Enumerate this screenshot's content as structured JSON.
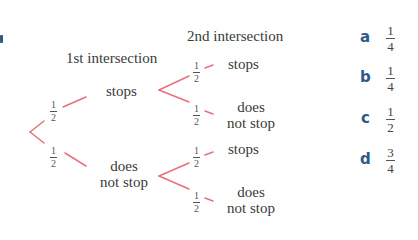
{
  "colors": {
    "branch": "#e8707c",
    "text": "#3a3a3a",
    "key": "#2e5a87"
  },
  "headers": {
    "first": "1st intersection",
    "second": "2nd intersection"
  },
  "tree": {
    "level1": [
      {
        "label": "stops",
        "prob": {
          "num": "1",
          "den": "2"
        }
      },
      {
        "label_line1": "does",
        "label_line2": "not stop",
        "prob": {
          "num": "1",
          "den": "2"
        }
      }
    ],
    "level2_top": [
      {
        "label": "stops",
        "prob": {
          "num": "1",
          "den": "2"
        }
      },
      {
        "label_line1": "does",
        "label_line2": "not stop",
        "prob": {
          "num": "1",
          "den": "2"
        }
      }
    ],
    "level2_bottom": [
      {
        "label": "stops",
        "prob": {
          "num": "1",
          "den": "2"
        }
      },
      {
        "label_line1": "does",
        "label_line2": "not stop",
        "prob": {
          "num": "1",
          "den": "2"
        }
      }
    ]
  },
  "answers": [
    {
      "key": "a",
      "num": "1",
      "den": "4"
    },
    {
      "key": "b",
      "num": "1",
      "den": "4"
    },
    {
      "key": "c",
      "num": "1",
      "den": "2"
    },
    {
      "key": "d",
      "num": "3",
      "den": "4"
    }
  ]
}
